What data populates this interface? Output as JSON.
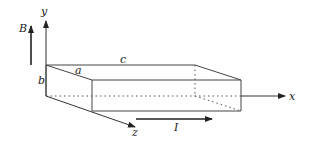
{
  "diagram": {
    "type": "3d-slab-with-axes",
    "axes": {
      "x_label": "x",
      "y_label": "y",
      "z_label": "z"
    },
    "dimensions": {
      "a_label": "a",
      "b_label": "b",
      "c_label": "c"
    },
    "field": {
      "label": "B",
      "direction": "+y"
    },
    "current": {
      "label": "I",
      "direction": "+x"
    },
    "colors": {
      "line": "#333333",
      "background": "#ffffff"
    }
  }
}
